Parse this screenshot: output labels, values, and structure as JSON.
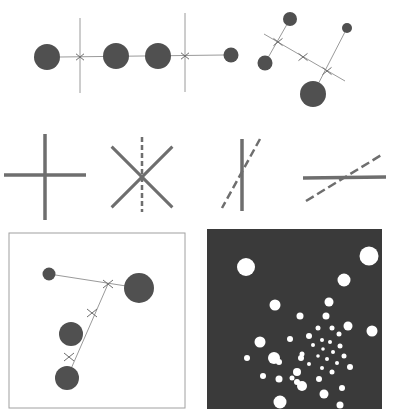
{
  "figure": {
    "colors": {
      "background": "#ffffff",
      "disc": "#505050",
      "line": "#9a9a9a",
      "stroke": "#6e6e6e",
      "panel_dark": "#3a3a3a",
      "panel_dot": "#ffffff",
      "panel_border": "#a0a0a0"
    }
  },
  "row1_left": {
    "discs": [
      {
        "cx": 47,
        "cy": 57,
        "r": 13
      },
      {
        "cx": 116,
        "cy": 56,
        "r": 13
      },
      {
        "cx": 158,
        "cy": 56,
        "r": 13
      },
      {
        "cx": 231,
        "cy": 55,
        "r": 7.5
      }
    ],
    "axis_line": {
      "x1": 60,
      "y1": 57,
      "x2": 224,
      "y2": 55
    },
    "crosses": [
      {
        "cx": 80,
        "cy": 57,
        "v_top": 18,
        "v_bottom": 93
      },
      {
        "cx": 185,
        "cy": 56,
        "v_top": 13,
        "v_bottom": 92
      }
    ]
  },
  "row1_right": {
    "discs": [
      {
        "cx": 290,
        "cy": 19,
        "r": 7
      },
      {
        "cx": 347,
        "cy": 28,
        "r": 5
      },
      {
        "cx": 265,
        "cy": 63,
        "r": 7.5
      },
      {
        "cx": 313,
        "cy": 94,
        "r": 13
      }
    ],
    "main_line": {
      "x1": 264,
      "y1": 34,
      "x2": 345,
      "y2": 81
    },
    "spokes": [
      {
        "x1": 290,
        "y1": 19,
        "x2": 265,
        "y2": 63
      },
      {
        "x1": 347,
        "y1": 28,
        "x2": 313,
        "y2": 94
      }
    ],
    "crosses": [
      {
        "cx": 278,
        "cy": 42
      },
      {
        "cx": 303,
        "cy": 57
      },
      {
        "cx": 327,
        "cy": 71
      }
    ]
  },
  "row2_glyphs": [
    {
      "type": "plus",
      "cx": 45,
      "cy": 175,
      "half_w": 41,
      "half_h": 45
    },
    {
      "type": "x-with-dashed-vertical",
      "cx": 142,
      "cy": 177,
      "size": 32
    },
    {
      "type": "vertical-with-dashed-diagonal",
      "cx": 242,
      "cy": 175
    },
    {
      "type": "horizontal-with-dashed-diagonal",
      "cx": 345,
      "cy": 177
    }
  ],
  "panel_left": {
    "frame": {
      "x": 9,
      "y": 233,
      "w": 176,
      "h": 175
    },
    "discs": [
      {
        "cx": 49,
        "cy": 274,
        "r": 6.5
      },
      {
        "cx": 139,
        "cy": 288,
        "r": 15
      },
      {
        "cx": 71,
        "cy": 334,
        "r": 12
      },
      {
        "cx": 67,
        "cy": 378,
        "r": 12
      }
    ],
    "lines": [
      {
        "x1": 49,
        "y1": 274,
        "x2": 139,
        "y2": 288
      },
      {
        "x1": 108,
        "y1": 284,
        "x2": 67,
        "y2": 378
      }
    ],
    "crosses": [
      {
        "cx": 108,
        "cy": 284
      },
      {
        "cx": 92,
        "cy": 313
      },
      {
        "cx": 69,
        "cy": 357
      }
    ]
  },
  "panel_right": {
    "frame": {
      "x": 207,
      "y": 229,
      "w": 175,
      "h": 180
    },
    "dots": [
      {
        "cx": 246,
        "cy": 267,
        "r": 9
      },
      {
        "cx": 369,
        "cy": 256,
        "r": 9.5
      },
      {
        "cx": 344,
        "cy": 280,
        "r": 6.5
      },
      {
        "cx": 275,
        "cy": 305,
        "r": 5.5
      },
      {
        "cx": 329,
        "cy": 302,
        "r": 4.5
      },
      {
        "cx": 300,
        "cy": 316,
        "r": 3.5
      },
      {
        "cx": 326,
        "cy": 316,
        "r": 3.5
      },
      {
        "cx": 348,
        "cy": 326,
        "r": 4.5
      },
      {
        "cx": 372,
        "cy": 331,
        "r": 5.5
      },
      {
        "cx": 260,
        "cy": 342,
        "r": 5.5
      },
      {
        "cx": 290,
        "cy": 339,
        "r": 3
      },
      {
        "cx": 318,
        "cy": 328,
        "r": 2.5
      },
      {
        "cx": 332,
        "cy": 328,
        "r": 2.5
      },
      {
        "cx": 339,
        "cy": 334,
        "r": 2.5
      },
      {
        "cx": 309,
        "cy": 336,
        "r": 3
      },
      {
        "cx": 322,
        "cy": 340,
        "r": 2
      },
      {
        "cx": 330,
        "cy": 342,
        "r": 2
      },
      {
        "cx": 340,
        "cy": 346,
        "r": 2.5
      },
      {
        "cx": 313,
        "cy": 345,
        "r": 2
      },
      {
        "cx": 323,
        "cy": 349,
        "r": 1.8
      },
      {
        "cx": 333,
        "cy": 352,
        "r": 2
      },
      {
        "cx": 344,
        "cy": 356,
        "r": 2.5
      },
      {
        "cx": 302,
        "cy": 354,
        "r": 2.5
      },
      {
        "cx": 318,
        "cy": 356,
        "r": 1.8
      },
      {
        "cx": 327,
        "cy": 359,
        "r": 2
      },
      {
        "cx": 337,
        "cy": 363,
        "r": 2
      },
      {
        "cx": 350,
        "cy": 367,
        "r": 3
      },
      {
        "cx": 309,
        "cy": 364,
        "r": 2
      },
      {
        "cx": 322,
        "cy": 368,
        "r": 2
      },
      {
        "cx": 332,
        "cy": 372,
        "r": 2.5
      },
      {
        "cx": 319,
        "cy": 379,
        "r": 3
      },
      {
        "cx": 297,
        "cy": 382,
        "r": 3
      },
      {
        "cx": 279,
        "cy": 379,
        "r": 3.5
      },
      {
        "cx": 247,
        "cy": 358,
        "r": 3
      },
      {
        "cx": 342,
        "cy": 388,
        "r": 3
      },
      {
        "cx": 301,
        "cy": 358,
        "r": 3
      },
      {
        "cx": 279,
        "cy": 362,
        "r": 3
      },
      {
        "cx": 263,
        "cy": 376,
        "r": 3
      },
      {
        "cx": 297,
        "cy": 372,
        "r": 4
      },
      {
        "cx": 324,
        "cy": 394,
        "r": 4.5
      },
      {
        "cx": 302,
        "cy": 386,
        "r": 5
      },
      {
        "cx": 280,
        "cy": 402,
        "r": 6.5
      },
      {
        "cx": 340,
        "cy": 405,
        "r": 3.5
      },
      {
        "cx": 274,
        "cy": 358,
        "r": 6
      },
      {
        "cx": 292,
        "cy": 378,
        "r": 2.5
      }
    ]
  }
}
